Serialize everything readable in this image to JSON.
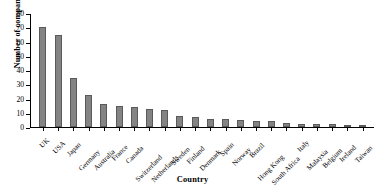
{
  "chart_data": {
    "type": "bar",
    "title": "",
    "xlabel": "Country",
    "ylabel": "Number of companies",
    "ylim": [
      0,
      80
    ],
    "yticks": [
      0,
      10,
      20,
      30,
      40,
      50,
      60,
      70,
      80
    ],
    "grid": false,
    "legend": false,
    "bar_color": "#848484",
    "bar_edge_color": "#5a5a5a",
    "categories": [
      "UK",
      "USA",
      "Japan",
      "Germany",
      "Australia",
      "France",
      "Canada",
      "Switzerland",
      "Netherlands",
      "Sweden",
      "Finland",
      "Denmark",
      "Spain",
      "Norway",
      "Brazil",
      "Hong Kong",
      "South Africa",
      "Italy",
      "Malaysia",
      "Belgium",
      "Ireland",
      "Taiwan"
    ],
    "values": [
      71,
      65,
      35,
      23,
      16,
      15,
      14,
      13,
      12,
      8,
      7,
      6,
      6,
      5,
      4,
      4,
      3,
      2,
      2,
      2,
      1,
      1
    ]
  }
}
